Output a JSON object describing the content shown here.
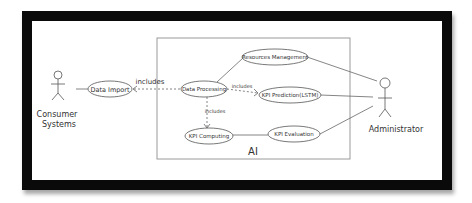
{
  "diagram": {
    "type": "use-case",
    "system_boundary": {
      "label": "AI"
    },
    "actors": [
      {
        "id": "consumer",
        "label_line1": "Consumer",
        "label_line2": "Systems"
      },
      {
        "id": "admin",
        "label": "Administrator"
      }
    ],
    "use_cases": [
      {
        "id": "data_import",
        "label": "Data Import"
      },
      {
        "id": "data_processing",
        "label": "Data Processing"
      },
      {
        "id": "resources_management",
        "label": "Resources Management"
      },
      {
        "id": "kpi_prediction",
        "label": "KPI Prediction(LSTM)"
      },
      {
        "id": "kpi_computing",
        "label": "KPI Computing"
      },
      {
        "id": "kpi_evaluation",
        "label": "KPI Evaluation"
      }
    ],
    "relations": [
      {
        "from": "consumer",
        "to": "data_import",
        "type": "association"
      },
      {
        "from": "data_processing",
        "to": "data_import",
        "type": "include",
        "label": "includes"
      },
      {
        "from": "data_processing",
        "to": "kpi_prediction",
        "type": "include",
        "label": "includes"
      },
      {
        "from": "data_processing",
        "to": "kpi_computing",
        "type": "include",
        "label": "includes"
      },
      {
        "from": "data_processing",
        "to": "resources_management",
        "type": "association"
      },
      {
        "from": "kpi_computing",
        "to": "kpi_evaluation",
        "type": "association"
      },
      {
        "from": "admin",
        "to": "resources_management",
        "type": "association"
      },
      {
        "from": "admin",
        "to": "kpi_prediction",
        "type": "association"
      },
      {
        "from": "admin",
        "to": "kpi_evaluation",
        "type": "association"
      }
    ],
    "labels": {
      "includes_import": "includes",
      "includes_prediction": "includes",
      "includes_computing": "includes"
    },
    "colors": {
      "frame": "#0a0a0a",
      "stroke": "#555555",
      "boundary": "#9a9a9a",
      "text": "#333333"
    }
  }
}
